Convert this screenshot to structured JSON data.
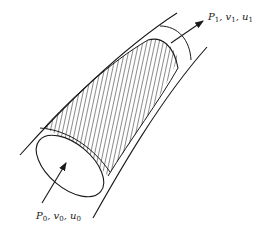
{
  "diagram": {
    "type": "stream-tube",
    "stroke_color": "#1a1a1a",
    "background_color": "#ffffff",
    "outlet": {
      "label": {
        "P": "P",
        "P_sub": "1",
        "v": "v",
        "v_sub": "1",
        "u": "u",
        "u_sub": "1"
      },
      "arrow_direction": "out"
    },
    "inlet": {
      "label": {
        "P": "P",
        "P_sub": "0",
        "v": "v",
        "v_sub": "0",
        "u": "u",
        "u_sub": "0"
      },
      "arrow_direction": "in"
    },
    "regions": [
      {
        "name": "control-volume",
        "fill": "hatched"
      }
    ]
  }
}
